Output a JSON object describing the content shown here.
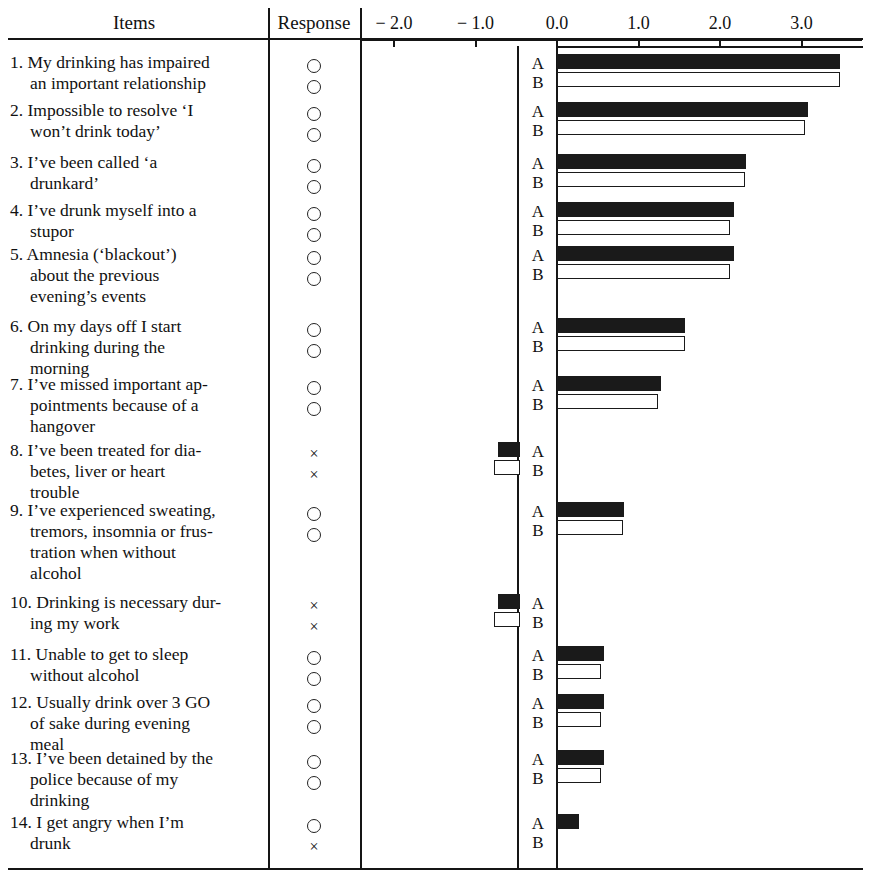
{
  "header": {
    "col_items": "Items",
    "col_response": "Response",
    "axis_ticks": [
      "− 2.0",
      "− 1.0",
      "0.0",
      "1.0",
      "2.0",
      "3.0",
      "4.0"
    ]
  },
  "series_labels": {
    "a": "A",
    "b": "B"
  },
  "marks": {
    "circle": "circle-open",
    "cross": "×"
  },
  "chart_data": {
    "type": "bar",
    "orientation": "horizontal",
    "title": "",
    "xlabel": "",
    "ylabel": "Items",
    "xlim": [
      -2.0,
      4.0
    ],
    "xticks": [
      -2.0,
      -1.0,
      0.0,
      1.0,
      2.0,
      3.0,
      4.0
    ],
    "grid": false,
    "legend": [
      "A",
      "B"
    ],
    "legend_position": "inline-left-of-bars",
    "categories": [
      "1. My drinking has impaired an important relationship",
      "2. Impossible to resolve ‘I won’t drink today’",
      "3. I’ve been called ‘a drunkard’",
      "4. I’ve drunk myself into a stupor",
      "5. Amnesia (‘blackout’) about the previous evening’s events",
      "6. On my days off I start drinking during the morning",
      "7. I’ve missed important appointments because of a hangover",
      "8. I’ve been treated for diabetes, liver or heart trouble",
      "9. I’ve experienced sweating, tremors, insomnia or frustration when without alcohol",
      "10. Drinking is necessary during my work",
      "11. Unable to get to sleep without alcohol",
      "12. Usually drink over 3 GO of sake during evening meal",
      "13. I’ve been detained by the police because of my drinking",
      "14. I get angry when I’m drunk"
    ],
    "series": [
      {
        "name": "A",
        "values": [
          3.45,
          3.05,
          2.3,
          2.15,
          2.15,
          1.55,
          1.25,
          -0.25,
          0.8,
          -0.25,
          0.55,
          0.55,
          0.55,
          0.25
        ]
      },
      {
        "name": "B",
        "values": [
          3.45,
          3.02,
          2.28,
          2.1,
          2.1,
          1.55,
          1.22,
          -0.3,
          0.78,
          -0.3,
          0.52,
          0.52,
          0.52,
          0.0
        ]
      }
    ]
  },
  "rows": [
    {
      "n": "1.",
      "lines": [
        "1. My drinking has impaired",
        "an important relationship"
      ],
      "response_a": "circle",
      "response_b": "circle"
    },
    {
      "n": "2.",
      "lines": [
        "2. Impossible to resolve ‘I",
        "won’t drink today’"
      ],
      "response_a": "circle",
      "response_b": "circle"
    },
    {
      "n": "3.",
      "lines": [
        "3. I’ve been called ‘a",
        "drunkard’"
      ],
      "response_a": "circle",
      "response_b": "circle"
    },
    {
      "n": "4.",
      "lines": [
        "4. I’ve drunk myself into a",
        "stupor"
      ],
      "response_a": "circle",
      "response_b": "circle"
    },
    {
      "n": "5.",
      "lines": [
        "5. Amnesia (‘blackout’)",
        "about the previous",
        "evening’s events"
      ],
      "response_a": "circle",
      "response_b": "circle"
    },
    {
      "n": "6.",
      "lines": [
        "6. On my days off I start",
        "drinking during the",
        "morning"
      ],
      "response_a": "circle",
      "response_b": "circle"
    },
    {
      "n": "7.",
      "lines": [
        "7. I’ve missed important ap-",
        "pointments because of a",
        "hangover"
      ],
      "response_a": "circle",
      "response_b": "circle"
    },
    {
      "n": "8.",
      "lines": [
        "8. I’ve been treated for dia-",
        "betes, liver or heart",
        "trouble"
      ],
      "response_a": "cross",
      "response_b": "cross"
    },
    {
      "n": "9.",
      "lines": [
        "9. I’ve experienced sweating,",
        "tremors, insomnia or frus-",
        "tration when without",
        "alcohol"
      ],
      "response_a": "circle",
      "response_b": "circle"
    },
    {
      "n": "10.",
      "lines": [
        "10. Drinking is necessary dur-",
        "ing my work"
      ],
      "response_a": "cross",
      "response_b": "cross"
    },
    {
      "n": "11.",
      "lines": [
        "11. Unable to get to sleep",
        "without alcohol"
      ],
      "response_a": "circle",
      "response_b": "circle"
    },
    {
      "n": "12.",
      "lines": [
        "12. Usually drink over 3 GO",
        "of sake during evening",
        "meal"
      ],
      "response_a": "circle",
      "response_b": "circle"
    },
    {
      "n": "13.",
      "lines": [
        "13. I’ve been detained by the",
        "police because of my",
        "drinking"
      ],
      "response_a": "circle",
      "response_b": "circle"
    },
    {
      "n": "14.",
      "lines": [
        "14. I get angry when I’m",
        "drunk"
      ],
      "response_a": "circle",
      "response_b": "cross"
    }
  ],
  "layout": {
    "row_tops": [
      52,
      100,
      152,
      200,
      244,
      316,
      374,
      440,
      500,
      592,
      644,
      692,
      748,
      812
    ],
    "bar_a_offsets": [
      8,
      8,
      8,
      8,
      8,
      8,
      8,
      8,
      8,
      8,
      8,
      8,
      8,
      8
    ],
    "bar_b_offsets": [
      26,
      26,
      26,
      26,
      26,
      26,
      26,
      26,
      26,
      26,
      26,
      26,
      26,
      26
    ]
  },
  "colors": {
    "ink": "#1a1a1a",
    "paper": "#ffffff",
    "series_a_fill": "#1a1a1a",
    "series_b_fill": "#ffffff"
  }
}
